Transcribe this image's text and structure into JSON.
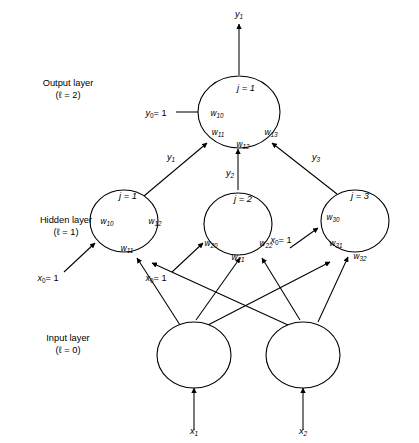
{
  "diagram": {
    "layers": [
      {
        "id": "output-layer",
        "name": "Output layer",
        "index_label": "(ℓ = 2)",
        "index_value": 2,
        "nodes": [
          {
            "id": "output-node-1",
            "index_label": "j = 1",
            "weights": [
              "w10",
              "w11",
              "w12",
              "w13"
            ],
            "weight_labels": [
              {
                "base": "w",
                "sub": "10"
              },
              {
                "base": "w",
                "sub": "11"
              },
              {
                "base": "w",
                "sub": "12"
              },
              {
                "base": "w",
                "sub": "13"
              }
            ]
          }
        ]
      },
      {
        "id": "hidden-layer",
        "name": "Hidden layer",
        "index_label": "(ℓ = 1)",
        "index_value": 1,
        "nodes": [
          {
            "id": "hidden-node-1",
            "index_label": "j = 1",
            "weights": [
              "w10",
              "w11",
              "w12"
            ],
            "weight_labels": [
              {
                "base": "w",
                "sub": "10"
              },
              {
                "base": "w",
                "sub": "11"
              },
              {
                "base": "w",
                "sub": "12"
              }
            ]
          },
          {
            "id": "hidden-node-2",
            "index_label": "j = 2",
            "weights": [
              "w20",
              "w21",
              "w22"
            ],
            "weight_labels": [
              {
                "base": "w",
                "sub": "20"
              },
              {
                "base": "w",
                "sub": "21"
              },
              {
                "base": "w",
                "sub": "22"
              }
            ]
          },
          {
            "id": "hidden-node-3",
            "index_label": "j = 3",
            "weights": [
              "w30",
              "w31",
              "w32"
            ],
            "weight_labels": [
              {
                "base": "w",
                "sub": "30"
              },
              {
                "base": "w",
                "sub": "31"
              },
              {
                "base": "w",
                "sub": "32"
              }
            ]
          }
        ]
      },
      {
        "id": "input-layer",
        "name": "Input layer",
        "index_label": "(ℓ = 0)",
        "index_value": 0,
        "nodes": [
          {
            "id": "input-node-1",
            "index_label": ""
          },
          {
            "id": "input-node-2",
            "index_label": ""
          }
        ]
      }
    ],
    "signals": {
      "network_output": {
        "base": "y",
        "sub": "1",
        "text": "y1"
      },
      "hidden_outputs": [
        {
          "base": "y",
          "sub": "1",
          "text": "y1"
        },
        {
          "base": "y",
          "sub": "2",
          "text": "y2"
        },
        {
          "base": "y",
          "sub": "3",
          "text": "y3"
        }
      ],
      "inputs": [
        {
          "base": "x",
          "sub": "1",
          "text": "x1"
        },
        {
          "base": "x",
          "sub": "2",
          "text": "x2"
        }
      ]
    },
    "biases": {
      "output_bias": {
        "base": "y",
        "sub": "0",
        "value": "= 1",
        "text": "y0 = 1"
      },
      "hidden_biases": [
        {
          "base": "x",
          "sub": "0",
          "value": "= 1",
          "text": "x0 = 1"
        },
        {
          "base": "x",
          "sub": "0",
          "value": "= 1",
          "text": "x0 = 1"
        },
        {
          "base": "x",
          "sub": "0",
          "value": "= 1",
          "text": "x0 = 1"
        }
      ]
    },
    "colors": {
      "stroke": "#000000",
      "background": "#ffffff",
      "text": "#000000"
    }
  }
}
